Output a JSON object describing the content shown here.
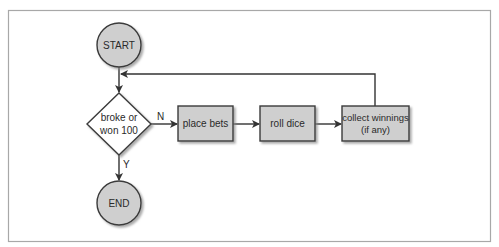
{
  "diagram": {
    "type": "flowchart",
    "colors": {
      "node_fill": "#cfcfcf",
      "node_stroke": "#3a3a3a",
      "edge": "#333333",
      "frame": "#a8a8a8",
      "shadow": "#9a9a9a"
    },
    "nodes": {
      "start": {
        "label": "START",
        "shape": "circle"
      },
      "decision": {
        "label_line1": "broke or",
        "label_line2": "won 100",
        "shape": "diamond"
      },
      "place_bets": {
        "label": "place bets",
        "shape": "rect"
      },
      "roll_dice": {
        "label": "roll dice",
        "shape": "rect"
      },
      "collect": {
        "label_line1": "collect winnings",
        "label_line2": "(if any)",
        "shape": "rect"
      },
      "end": {
        "label": "END",
        "shape": "circle"
      }
    },
    "edges": [
      {
        "from": "start",
        "to": "decision",
        "label": ""
      },
      {
        "from": "decision",
        "to": "place_bets",
        "label": "N"
      },
      {
        "from": "place_bets",
        "to": "roll_dice",
        "label": ""
      },
      {
        "from": "roll_dice",
        "to": "collect",
        "label": ""
      },
      {
        "from": "collect",
        "to": "decision",
        "label": ""
      },
      {
        "from": "decision",
        "to": "end",
        "label": "Y"
      }
    ],
    "edge_labels": {
      "no": "N",
      "yes": "Y"
    }
  }
}
